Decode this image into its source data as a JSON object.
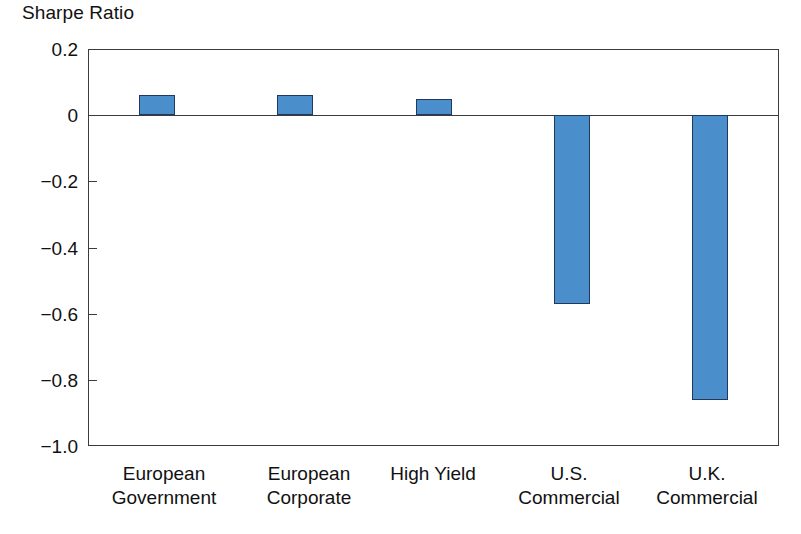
{
  "chart_data": {
    "type": "bar",
    "title": "Sharpe Ratio",
    "xlabel": "",
    "ylabel": "Sharpe Ratio",
    "categories": [
      "European Government",
      "European Corporate",
      "High Yield",
      "U.S. Commercial",
      "U.K. Commercial"
    ],
    "category_lines": [
      {
        "line1": "European",
        "line2": "Government"
      },
      {
        "line1": "European",
        "line2": "Corporate"
      },
      {
        "line1": "High Yield",
        "line2": ""
      },
      {
        "line1": "U.S.",
        "line2": "Commercial"
      },
      {
        "line1": "U.K.",
        "line2": "Commercial"
      }
    ],
    "values": [
      0.06,
      0.06,
      0.05,
      -0.57,
      -0.86
    ],
    "ylim": [
      -1.0,
      0.2
    ],
    "yticks": [
      0.2,
      0,
      -0.2,
      -0.4,
      -0.6,
      -0.8,
      -1.0
    ],
    "ytick_labels": [
      "0.2",
      "0",
      "−0.2",
      "−0.4",
      "−0.6",
      "−0.8",
      "−1.0"
    ],
    "grid": false,
    "legend": "none",
    "zero_line": true,
    "series_color": "#4a8ecb",
    "series_border_color": "#21395c",
    "axis_color": "#3b3b3b"
  }
}
